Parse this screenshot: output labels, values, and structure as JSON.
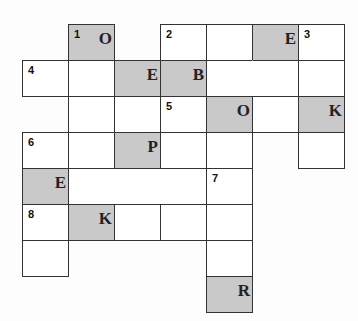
{
  "puzzle": {
    "type": "crossword",
    "shade_color": "#c9c9c9",
    "cells": [
      {
        "row": 0,
        "col": 1,
        "number": "1",
        "letter": "O",
        "shaded": true
      },
      {
        "row": 0,
        "col": 3,
        "number": "2",
        "letter": "",
        "shaded": false
      },
      {
        "row": 0,
        "col": 4,
        "number": "",
        "letter": "",
        "shaded": false
      },
      {
        "row": 0,
        "col": 5,
        "number": "",
        "letter": "E",
        "shaded": true
      },
      {
        "row": 0,
        "col": 6,
        "number": "3",
        "letter": "",
        "shaded": false
      },
      {
        "row": 1,
        "col": 0,
        "number": "4",
        "letter": "",
        "shaded": false
      },
      {
        "row": 1,
        "col": 1,
        "number": "",
        "letter": "",
        "shaded": false
      },
      {
        "row": 1,
        "col": 2,
        "number": "",
        "letter": "E",
        "shaded": true
      },
      {
        "row": 1,
        "col": 3,
        "number": "",
        "letter": "B",
        "shaded": true
      },
      {
        "row": 1,
        "col": 4,
        "number": "",
        "letter": "",
        "shaded": false
      },
      {
        "row": 1,
        "col": 5,
        "number": "",
        "letter": "",
        "shaded": false
      },
      {
        "row": 1,
        "col": 6,
        "number": "",
        "letter": "",
        "shaded": false
      },
      {
        "row": 2,
        "col": 1,
        "number": "",
        "letter": "",
        "shaded": false
      },
      {
        "row": 2,
        "col": 2,
        "number": "",
        "letter": "",
        "shaded": false
      },
      {
        "row": 2,
        "col": 3,
        "number": "5",
        "letter": "",
        "shaded": false
      },
      {
        "row": 2,
        "col": 4,
        "number": "",
        "letter": "O",
        "shaded": true
      },
      {
        "row": 2,
        "col": 5,
        "number": "",
        "letter": "",
        "shaded": false
      },
      {
        "row": 2,
        "col": 6,
        "number": "",
        "letter": "K",
        "shaded": true
      },
      {
        "row": 3,
        "col": 0,
        "number": "6",
        "letter": "",
        "shaded": false
      },
      {
        "row": 3,
        "col": 1,
        "number": "",
        "letter": "",
        "shaded": false
      },
      {
        "row": 3,
        "col": 2,
        "number": "",
        "letter": "P",
        "shaded": true
      },
      {
        "row": 3,
        "col": 3,
        "number": "",
        "letter": "",
        "shaded": false
      },
      {
        "row": 3,
        "col": 4,
        "number": "",
        "letter": "",
        "shaded": false
      },
      {
        "row": 3,
        "col": 6,
        "number": "",
        "letter": "",
        "shaded": false
      },
      {
        "row": 4,
        "col": 0,
        "number": "",
        "letter": "E",
        "shaded": true
      },
      {
        "row": 4,
        "col": 4,
        "number": "7",
        "letter": "",
        "shaded": false
      },
      {
        "row": 5,
        "col": 0,
        "number": "8",
        "letter": "",
        "shaded": false
      },
      {
        "row": 5,
        "col": 1,
        "number": "",
        "letter": "K",
        "shaded": true
      },
      {
        "row": 5,
        "col": 2,
        "number": "",
        "letter": "",
        "shaded": false
      },
      {
        "row": 5,
        "col": 3,
        "number": "",
        "letter": "",
        "shaded": false
      },
      {
        "row": 5,
        "col": 4,
        "number": "",
        "letter": "",
        "shaded": false
      },
      {
        "row": 6,
        "col": 0,
        "number": "",
        "letter": "",
        "shaded": false
      },
      {
        "row": 6,
        "col": 4,
        "number": "",
        "letter": "",
        "shaded": false
      },
      {
        "row": 7,
        "col": 4,
        "number": "",
        "letter": "R",
        "shaded": true
      }
    ]
  }
}
